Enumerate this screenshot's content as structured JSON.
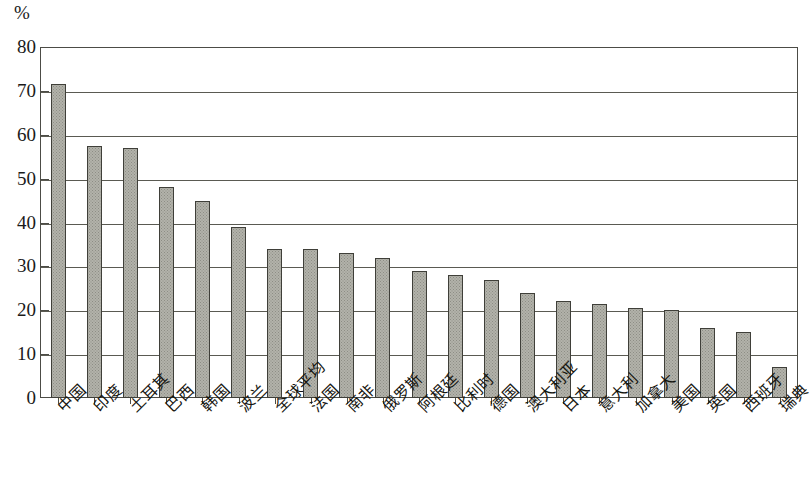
{
  "chart_data": {
    "type": "bar",
    "title": "",
    "subtitle": "",
    "xlabel": "",
    "ylabel": "%",
    "unit_label": "%",
    "ylim": [
      0,
      80
    ],
    "ytick_step": 10,
    "yticks": [
      0,
      10,
      20,
      30,
      40,
      50,
      60,
      70,
      80
    ],
    "ytick_labels": [
      "0",
      "10",
      "20",
      "30",
      "40",
      "50",
      "60",
      "70",
      "80"
    ],
    "grid": true,
    "grid_axis": "y",
    "legend": false,
    "legend_position": "none",
    "bar_fill_color": "#b2b2aa",
    "bar_edge_color": "#3f3f39",
    "frame_color": "#4c4c46",
    "background_color": "#ffffff",
    "categories": [
      "中国",
      "印度",
      "土耳其",
      "巴西",
      "韩国",
      "波兰",
      "全球平均",
      "法国",
      "南非",
      "俄罗斯",
      "阿根廷",
      "比利时",
      "德国",
      "澳大利亚",
      "日本",
      "意大利",
      "加拿大",
      "美国",
      "英国",
      "西班牙",
      "瑞典"
    ],
    "values": [
      71.5,
      57.5,
      57,
      48,
      45,
      39,
      34,
      34,
      33,
      32,
      29,
      28,
      27,
      24,
      22,
      21.5,
      20.5,
      20,
      16,
      15,
      7
    ],
    "series": [
      {
        "name": "",
        "values": [
          71.5,
          57.5,
          57,
          48,
          45,
          39,
          34,
          34,
          33,
          32,
          29,
          28,
          27,
          24,
          22,
          21.5,
          20.5,
          20,
          16,
          15,
          7
        ]
      }
    ]
  }
}
